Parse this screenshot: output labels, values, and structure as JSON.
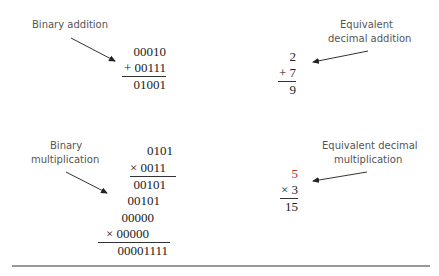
{
  "binary_addition": {
    "label": "Binary addition",
    "rows": [
      "00010",
      "+ 00111",
      "01001"
    ]
  },
  "decimal_addition": {
    "label_line1": "Equivalent",
    "label_line2": "decimal addition",
    "rows": [
      "2",
      "+ 7",
      "9"
    ]
  },
  "binary_multiplication": {
    "label_line1": "Binary",
    "label_line2": "multiplication",
    "rows": [
      "0101",
      "× 0011",
      "00101",
      "00101",
      "00000",
      "× 00000",
      "00001111"
    ]
  },
  "decimal_multiplication": {
    "label_line1": "Equivalent decimal",
    "label_line2": "multiplication",
    "rows": [
      "5",
      "× 3",
      "15"
    ]
  },
  "colors": {
    "highlight": "#b03030",
    "text": "#222222",
    "label": "#555555"
  }
}
